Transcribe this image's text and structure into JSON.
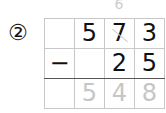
{
  "problem": {
    "number_label": "②",
    "borrow_mark": "6",
    "rows": [
      [
        "",
        "5",
        "7",
        "3"
      ],
      [
        "−",
        "",
        "2",
        "5"
      ]
    ],
    "answer": [
      "",
      "5",
      "4",
      "8"
    ]
  }
}
